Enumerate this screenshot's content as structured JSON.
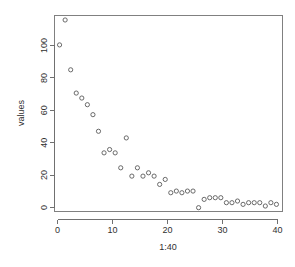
{
  "chart_data": {
    "type": "scatter",
    "title": "",
    "subtitle": "",
    "xlabel": "1:40",
    "ylabel": "values",
    "xlim": [
      0.0,
      41.0
    ],
    "ylim": [
      -2.0,
      116.0
    ],
    "grid": false,
    "legend": null,
    "legend_position": "none",
    "marker": "open-circle",
    "marker_color": "#5a5a5a",
    "xticks": [
      0,
      10,
      20,
      30,
      40
    ],
    "xtick_labels": [
      "0",
      "10",
      "20",
      "30",
      "40"
    ],
    "yticks": [
      0,
      20,
      40,
      60,
      80,
      100
    ],
    "ytick_labels": [
      "0",
      "20",
      "40",
      "60",
      "80",
      "100"
    ],
    "x": [
      1,
      2,
      3,
      4,
      5,
      6,
      7,
      8,
      9,
      10,
      11,
      12,
      13,
      14,
      15,
      16,
      17,
      18,
      19,
      20,
      21,
      22,
      23,
      24,
      25,
      26,
      27,
      28,
      29,
      30,
      31,
      32,
      33,
      34,
      35,
      36,
      37,
      38,
      39,
      40
    ],
    "y": [
      98,
      113,
      83,
      69,
      66,
      62,
      56,
      46,
      33,
      35,
      33,
      24,
      42,
      19,
      24,
      19,
      21,
      19,
      14,
      17,
      9,
      10,
      9,
      10,
      10,
      0,
      5,
      6,
      6,
      6,
      3,
      3,
      4,
      2,
      3,
      3,
      3,
      1,
      3,
      2
    ],
    "n_points": 40,
    "series": [
      {
        "name": "values",
        "values": [
          98,
          113,
          83,
          69,
          66,
          62,
          56,
          46,
          33,
          35,
          33,
          24,
          42,
          19,
          24,
          19,
          21,
          19,
          14,
          17,
          9,
          10,
          9,
          10,
          10,
          0,
          5,
          6,
          6,
          6,
          3,
          3,
          4,
          2,
          3,
          3,
          3,
          1,
          3,
          2
        ]
      }
    ]
  },
  "axes": {
    "x_axis_title": "1:40",
    "y_axis_title": "values"
  },
  "plot_geometry": {
    "left": 54,
    "right": 282,
    "top": 15,
    "bottom": 211
  }
}
